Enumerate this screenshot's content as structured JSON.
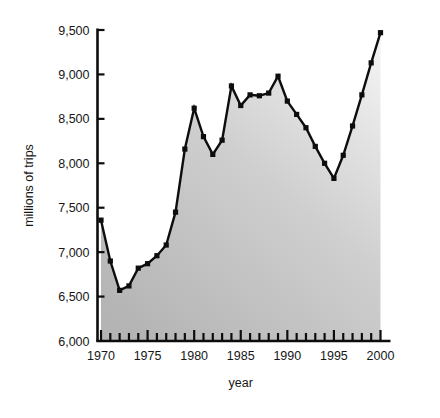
{
  "chart_data": {
    "type": "line",
    "title": "",
    "subtitle": "",
    "xlabel": "year",
    "ylabel": "millions of trips",
    "xlim": [
      1970,
      2000
    ],
    "ylim": [
      6000,
      9500
    ],
    "grid": false,
    "legend": false,
    "legend_position": "none",
    "marker": "square",
    "fill": "area-below-gradient-gray",
    "y_ticks": [
      6000,
      6500,
      7000,
      7500,
      8000,
      8500,
      9000,
      9500
    ],
    "y_tick_labels": [
      "6,000",
      "6,500",
      "7,000",
      "7,500",
      "8,000",
      "8,500",
      "9,000",
      "9,500"
    ],
    "x_ticks": [
      1970,
      1975,
      1980,
      1985,
      1990,
      1995,
      2000
    ],
    "x_tick_labels": [
      "1970",
      "1975",
      "1980",
      "1985",
      "1990",
      "1995",
      "2000"
    ],
    "x_minor_tick_interval": 1,
    "x": [
      1970,
      1971,
      1972,
      1973,
      1974,
      1975,
      1976,
      1977,
      1978,
      1979,
      1980,
      1981,
      1982,
      1983,
      1984,
      1985,
      1986,
      1987,
      1988,
      1989,
      1990,
      1991,
      1992,
      1993,
      1994,
      1995,
      1996,
      1997,
      1998,
      1999,
      2000
    ],
    "values": [
      7360,
      6900,
      6570,
      6620,
      6820,
      6870,
      6960,
      7080,
      7450,
      8160,
      8620,
      8300,
      8100,
      8260,
      8870,
      8650,
      8770,
      8760,
      8790,
      8980,
      8700,
      8550,
      8400,
      8190,
      8000,
      7830,
      8090,
      8420,
      8770,
      9130,
      9470
    ],
    "series": [
      {
        "name": "millions of trips",
        "color": "#0d0d0d",
        "values": [
          7360,
          6900,
          6570,
          6620,
          6820,
          6870,
          6960,
          7080,
          7450,
          8160,
          8620,
          8300,
          8100,
          8260,
          8870,
          8650,
          8770,
          8760,
          8790,
          8980,
          8700,
          8550,
          8400,
          8190,
          8000,
          7830,
          8090,
          8420,
          8770,
          9130,
          9470
        ]
      }
    ],
    "colors": {
      "line": "#0d0d0d",
      "marker": "#0d0d0d",
      "axis": "#0d0d0d",
      "fill_top": "#f2f2f2",
      "fill_bottom": "#b4b4b4",
      "background": "#ffffff",
      "text": "#161616"
    }
  }
}
